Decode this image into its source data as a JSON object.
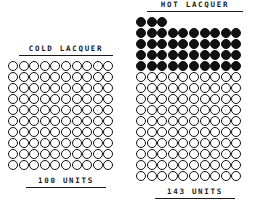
{
  "chart_data": {
    "type": "pictogram",
    "title": "",
    "unit_symbol": "circle",
    "unit_value": 1,
    "series": [
      {
        "name": "COLD LACQUER",
        "label": "COLD LACQUER",
        "footer": "100 UNITS",
        "value": 100,
        "filled_count": 0,
        "open_count": 100,
        "columns": 10,
        "filled_rows": [],
        "open_rows": [
          10,
          10,
          10,
          10,
          10,
          10,
          10,
          10,
          10,
          10
        ]
      },
      {
        "name": "HOT LACQUER",
        "label": "HOT LACQUER",
        "footer": "143 UNITS",
        "value": 143,
        "filled_count": 43,
        "open_count": 100,
        "columns": 10,
        "filled_rows": [
          3,
          10,
          10,
          10,
          10
        ],
        "open_rows": [
          10,
          10,
          10,
          10,
          10,
          10,
          10,
          10,
          10,
          10
        ]
      }
    ],
    "colors": {
      "filled": "#111111",
      "open_outline": "#111111",
      "background": "#ffffff",
      "text": "#1a1a1a"
    },
    "legend": [],
    "annotations": []
  },
  "cold": {
    "title": "COLD LACQUER",
    "footer": "100 UNITS"
  },
  "hot": {
    "title": "HOT LACQUER",
    "footer": "143 UNITS"
  }
}
